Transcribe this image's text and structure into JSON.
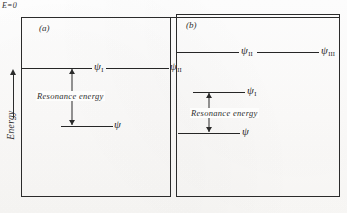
{
  "figure": {
    "reference_label": "E=0",
    "axis": {
      "label": "Energy",
      "direction_icon": "up-arrow-icon"
    },
    "panels": [
      {
        "id": "a",
        "caption": "(a)",
        "resonance_label": "Resonance energy",
        "levels": [
          {
            "name": "upper",
            "labels": [
              {
                "symbol": "ψ",
                "subscript": "I"
              },
              {
                "symbol": "ψ",
                "subscript": "II"
              }
            ]
          },
          {
            "name": "lower",
            "labels": [
              {
                "symbol": "ψ",
                "subscript": ""
              }
            ]
          }
        ]
      },
      {
        "id": "b",
        "caption": "(b)",
        "resonance_label": "Resonance energy",
        "levels": [
          {
            "name": "upper",
            "labels": [
              {
                "symbol": "ψ",
                "subscript": "II"
              },
              {
                "symbol": "ψ",
                "subscript": "III"
              }
            ]
          },
          {
            "name": "middle",
            "labels": [
              {
                "symbol": "ψ",
                "subscript": "I"
              }
            ]
          },
          {
            "name": "lower",
            "labels": [
              {
                "symbol": "ψ",
                "subscript": ""
              }
            ]
          }
        ]
      }
    ],
    "colors": {
      "ink": "#262626",
      "frame": "#2b2b2b",
      "paper": "#fdfdfc"
    }
  }
}
